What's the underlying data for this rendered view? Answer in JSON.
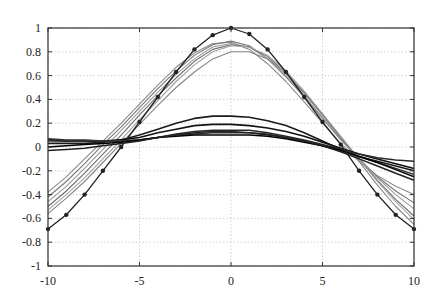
{
  "chart_data": {
    "type": "line",
    "title": "",
    "xlabel": "",
    "ylabel": "",
    "xlim": [
      -10,
      10
    ],
    "ylim": [
      -1,
      1
    ],
    "grid": true,
    "legend": null,
    "x_ticks": [
      -10,
      -5,
      0,
      5,
      10
    ],
    "x_tick_labels": [
      "-10",
      "-5",
      "0",
      "5",
      "10"
    ],
    "y_ticks": [
      -1,
      -0.8,
      -0.6,
      -0.4,
      -0.2,
      0,
      0.2,
      0.4,
      0.6,
      0.8,
      1
    ],
    "y_tick_labels": [
      "-1",
      "-0.8",
      "-0.6",
      "-0.4",
      "-0.2",
      "0",
      "0.2",
      "0.4",
      "0.6",
      "0.8",
      "1"
    ],
    "x": [
      -10,
      -9,
      -8,
      -7,
      -6,
      -5,
      -4,
      -3,
      -2,
      -1,
      0,
      1,
      2,
      3,
      4,
      5,
      6,
      7,
      8,
      9,
      10
    ],
    "series": [
      {
        "name": "target",
        "color": "#222222",
        "width": 1.3,
        "markers": true,
        "values": [
          -0.69,
          -0.57,
          -0.4,
          -0.2,
          0.0,
          0.21,
          0.42,
          0.63,
          0.82,
          0.94,
          1.0,
          0.95,
          0.82,
          0.63,
          0.42,
          0.21,
          0.02,
          -0.2,
          -0.4,
          -0.57,
          -0.69
        ]
      },
      {
        "name": "gray-1",
        "color": "#8a8a8a",
        "width": 1.1,
        "markers": false,
        "values": [
          -0.38,
          -0.25,
          -0.1,
          0.05,
          0.2,
          0.36,
          0.52,
          0.67,
          0.79,
          0.87,
          0.88,
          0.82,
          0.7,
          0.55,
          0.38,
          0.2,
          0.03,
          -0.12,
          -0.24,
          -0.33,
          -0.4
        ]
      },
      {
        "name": "gray-2",
        "color": "#777777",
        "width": 1.1,
        "markers": false,
        "values": [
          -0.42,
          -0.29,
          -0.14,
          0.02,
          0.17,
          0.33,
          0.49,
          0.64,
          0.77,
          0.86,
          0.89,
          0.85,
          0.74,
          0.59,
          0.42,
          0.24,
          0.06,
          -0.1,
          -0.25,
          -0.37,
          -0.47
        ]
      },
      {
        "name": "gray-3",
        "color": "#999999",
        "width": 1.1,
        "markers": false,
        "values": [
          -0.46,
          -0.33,
          -0.18,
          -0.02,
          0.14,
          0.3,
          0.46,
          0.61,
          0.74,
          0.84,
          0.87,
          0.84,
          0.74,
          0.6,
          0.43,
          0.25,
          0.07,
          -0.1,
          -0.26,
          -0.4,
          -0.52
        ]
      },
      {
        "name": "gray-4",
        "color": "#6e6e6e",
        "width": 1.1,
        "markers": false,
        "values": [
          -0.5,
          -0.37,
          -0.22,
          -0.06,
          0.1,
          0.27,
          0.43,
          0.58,
          0.72,
          0.82,
          0.86,
          0.84,
          0.76,
          0.62,
          0.45,
          0.27,
          0.08,
          -0.1,
          -0.28,
          -0.44,
          -0.58
        ]
      },
      {
        "name": "gray-5",
        "color": "#a0a0a0",
        "width": 1.1,
        "markers": false,
        "values": [
          -0.53,
          -0.4,
          -0.26,
          -0.1,
          0.06,
          0.23,
          0.39,
          0.55,
          0.69,
          0.8,
          0.85,
          0.84,
          0.77,
          0.64,
          0.47,
          0.28,
          0.09,
          -0.1,
          -0.29,
          -0.46,
          -0.61
        ]
      },
      {
        "name": "gray-6",
        "color": "#858585",
        "width": 1.1,
        "markers": false,
        "values": [
          -0.56,
          -0.43,
          -0.29,
          -0.13,
          0.03,
          0.19,
          0.35,
          0.5,
          0.63,
          0.74,
          0.8,
          0.8,
          0.74,
          0.62,
          0.46,
          0.27,
          0.08,
          -0.12,
          -0.32,
          -0.5,
          -0.65
        ]
      },
      {
        "name": "dark-1",
        "color": "#1a1a1a",
        "width": 1.6,
        "markers": false,
        "values": [
          0.03,
          0.03,
          0.03,
          0.04,
          0.06,
          0.1,
          0.15,
          0.2,
          0.24,
          0.26,
          0.26,
          0.25,
          0.22,
          0.18,
          0.12,
          0.05,
          -0.02,
          -0.08,
          -0.12,
          -0.16,
          -0.2
        ]
      },
      {
        "name": "dark-2",
        "color": "#111111",
        "width": 1.6,
        "markers": false,
        "values": [
          0.06,
          0.05,
          0.05,
          0.05,
          0.06,
          0.08,
          0.12,
          0.15,
          0.18,
          0.19,
          0.19,
          0.18,
          0.16,
          0.13,
          0.09,
          0.04,
          -0.01,
          -0.06,
          -0.1,
          -0.14,
          -0.18
        ]
      },
      {
        "name": "dark-3",
        "color": "#2a2a2a",
        "width": 1.5,
        "markers": false,
        "values": [
          0.07,
          0.06,
          0.06,
          0.05,
          0.05,
          0.06,
          0.08,
          0.11,
          0.13,
          0.14,
          0.14,
          0.14,
          0.12,
          0.09,
          0.06,
          0.02,
          -0.02,
          -0.06,
          -0.09,
          -0.11,
          -0.12
        ]
      },
      {
        "name": "dark-4",
        "color": "#333333",
        "width": 1.5,
        "markers": false,
        "values": [
          0.05,
          0.05,
          0.05,
          0.05,
          0.05,
          0.06,
          0.08,
          0.1,
          0.11,
          0.12,
          0.12,
          0.12,
          0.11,
          0.08,
          0.05,
          0.01,
          -0.03,
          -0.08,
          -0.13,
          -0.18,
          -0.23
        ]
      },
      {
        "name": "dark-5",
        "color": "#000000",
        "width": 1.5,
        "markers": false,
        "values": [
          0.0,
          0.01,
          0.02,
          0.03,
          0.04,
          0.06,
          0.08,
          0.09,
          0.1,
          0.1,
          0.1,
          0.1,
          0.09,
          0.07,
          0.04,
          0.01,
          -0.03,
          -0.08,
          -0.13,
          -0.19,
          -0.25
        ]
      },
      {
        "name": "dark-6",
        "color": "#222222",
        "width": 1.5,
        "markers": false,
        "values": [
          -0.03,
          -0.02,
          -0.01,
          0.01,
          0.03,
          0.05,
          0.08,
          0.1,
          0.12,
          0.13,
          0.13,
          0.12,
          0.1,
          0.08,
          0.05,
          0.01,
          -0.04,
          -0.1,
          -0.16,
          -0.22,
          -0.28
        ]
      }
    ]
  },
  "layout": {
    "plot_left": 48,
    "plot_right": 414,
    "plot_top": 28,
    "plot_bottom": 266
  }
}
